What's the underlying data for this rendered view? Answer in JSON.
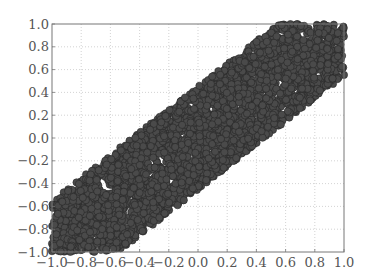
{
  "chart_data": {
    "type": "scatter",
    "title": "",
    "xlabel": "",
    "ylabel": "",
    "xlim": [
      -1.0,
      1.0
    ],
    "ylim": [
      -1.0,
      1.0
    ],
    "grid": true,
    "legend": null,
    "x_ticks": [
      "−1.0",
      "−0.8",
      "−0.6",
      "−0.4",
      "−0.2",
      "0.0",
      "0.2",
      "0.4",
      "0.6",
      "0.8",
      "1.0"
    ],
    "y_ticks": [
      "1.0",
      "0.8",
      "0.6",
      "0.4",
      "0.2",
      "0.0",
      "−0.2",
      "−0.4",
      "−0.6",
      "−0.8",
      "−1.0"
    ],
    "x_tick_values": [
      -1.0,
      -0.8,
      -0.6,
      -0.4,
      -0.2,
      0.0,
      0.2,
      0.4,
      0.6,
      0.8,
      1.0
    ],
    "y_tick_values": [
      1.0,
      0.8,
      0.6,
      0.4,
      0.2,
      0.0,
      -0.2,
      -0.4,
      -0.6,
      -0.8,
      -1.0
    ],
    "series": [
      {
        "name": "points",
        "marker": "circle",
        "color": "#4a4a4a",
        "edge_color": "#262626",
        "count_approx": 3000,
        "distribution": "dense diagonal band y = x + offset, offset uniform in [-0.45, 0.45], clipped to [-1,1]",
        "band_center_slope": 1.0,
        "band_half_width": 0.45,
        "sample_points": [
          [
            -1.0,
            -0.6
          ],
          [
            -1.0,
            -0.95
          ],
          [
            -0.8,
            -0.4
          ],
          [
            -0.8,
            -1.0
          ],
          [
            -0.6,
            -0.2
          ],
          [
            -0.6,
            -0.95
          ],
          [
            -0.4,
            0.0
          ],
          [
            -0.4,
            -0.8
          ],
          [
            -0.2,
            0.25
          ],
          [
            -0.2,
            -0.6
          ],
          [
            0.0,
            0.4
          ],
          [
            0.0,
            -0.4
          ],
          [
            0.2,
            0.6
          ],
          [
            0.2,
            -0.2
          ],
          [
            0.4,
            0.8
          ],
          [
            0.4,
            0.0
          ],
          [
            0.6,
            0.98
          ],
          [
            0.6,
            0.15
          ],
          [
            0.8,
            1.0
          ],
          [
            0.8,
            0.35
          ],
          [
            1.0,
            0.95
          ],
          [
            1.0,
            0.55
          ]
        ]
      }
    ]
  }
}
